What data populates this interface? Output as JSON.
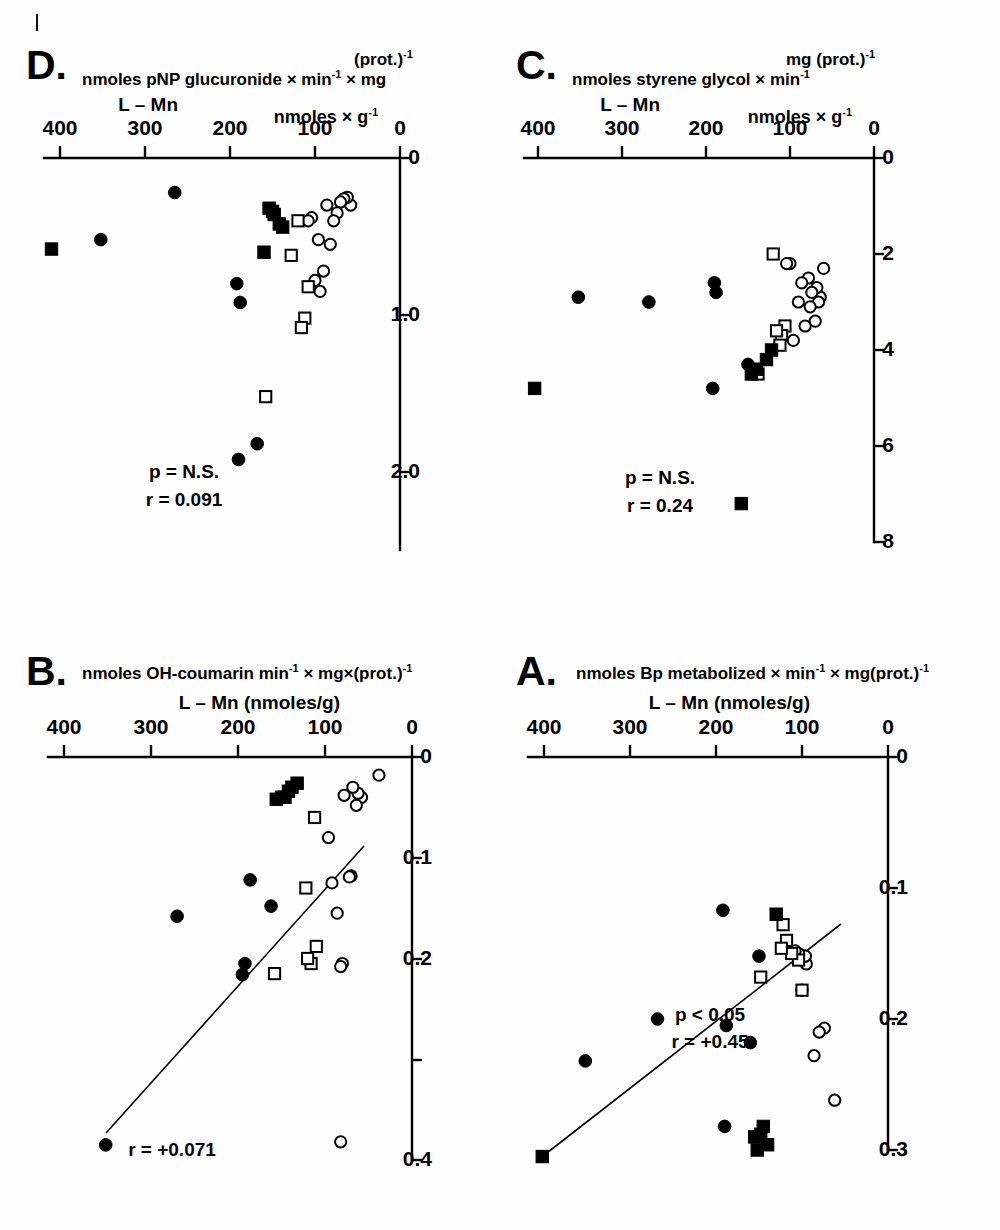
{
  "figure": {
    "title_absent": "",
    "orientation_note": "rotated-180",
    "panels": [
      "A.",
      "B.",
      "C.",
      "D."
    ],
    "marker_legend": {
      "filled_circle": "filled circle",
      "open_circle": "open circle",
      "filled_square": "filled square",
      "open_square": "open square"
    }
  },
  "chart_data": [
    {
      "type": "scatter",
      "panel": "A.",
      "title": "A.",
      "xlabel": "L - Mn (nmoles/g)",
      "ylabel": "nmoles Bp metabolized × min⁻¹ × mg(prot.)⁻¹",
      "xlim": [
        0,
        420
      ],
      "ylim": [
        0,
        0.32
      ],
      "xticks": [
        0,
        100,
        200,
        300,
        400
      ],
      "xticklabels": [
        "0",
        "100",
        "200",
        "300",
        "400"
      ],
      "yticks": [
        0,
        0.1,
        0.2,
        0.3
      ],
      "yticklabels": [
        "0",
        "0.1",
        "0.2",
        "0.3"
      ],
      "grid": false,
      "annotations": [
        "r = +0.45",
        "p < 0.05"
      ],
      "regression_line": {
        "x": [
          55,
          402
        ],
        "y": [
          0.128,
          0.305
        ]
      },
      "series": [
        {
          "name": "open circle",
          "marker": "open-circle",
          "points": [
            [
              62,
              0.262
            ],
            [
              74,
              0.207
            ],
            [
              80,
              0.21
            ],
            [
              86,
              0.228
            ],
            [
              95,
              0.158
            ],
            [
              97,
              0.152
            ],
            [
              96,
              0.152
            ],
            [
              100,
              0.178
            ],
            [
              104,
              0.15
            ],
            [
              108,
              0.148
            ],
            [
              112,
              0.15
            ],
            [
              118,
              0.143
            ]
          ]
        },
        {
          "name": "open square",
          "marker": "open-square",
          "points": [
            [
              100,
              0.178
            ],
            [
              104,
              0.155
            ],
            [
              112,
              0.15
            ],
            [
              118,
              0.14
            ],
            [
              122,
              0.128
            ],
            [
              124,
              0.146
            ],
            [
              148,
              0.168
            ]
          ]
        },
        {
          "name": "filled circle",
          "marker": "filled-circle",
          "points": [
            [
              150,
              0.152
            ],
            [
              160,
              0.218
            ],
            [
              188,
              0.205
            ],
            [
              190,
              0.282
            ],
            [
              192,
              0.117
            ],
            [
              268,
              0.2
            ],
            [
              352,
              0.232
            ]
          ]
        },
        {
          "name": "filled square",
          "marker": "filled-square",
          "points": [
            [
              130,
              0.12
            ],
            [
              140,
              0.296
            ],
            [
              145,
              0.282
            ],
            [
              148,
              0.288
            ],
            [
              152,
              0.3
            ],
            [
              155,
              0.29
            ],
            [
              402,
              0.305
            ]
          ]
        }
      ]
    },
    {
      "type": "scatter",
      "panel": "B.",
      "title": "B.",
      "xlabel": "L - Mn (nmoles/g)",
      "ylabel": "nmoles OH-coumarin min⁻¹ × mg×(prot.)⁻¹",
      "xlim": [
        0,
        420
      ],
      "ylim": [
        0,
        0.44
      ],
      "xticks": [
        0,
        100,
        200,
        300,
        400
      ],
      "xticklabels": [
        "0",
        "100",
        "200",
        "300",
        "400"
      ],
      "yticks": [
        0,
        0.1,
        0.2,
        0.3,
        0.4
      ],
      "yticklabels": [
        "0",
        "0.1",
        "0.2",
        "",
        "0.4"
      ],
      "grid": false,
      "annotations": [
        "r = +0.071"
      ],
      "regression_line": {
        "x": [
          55,
          352
        ],
        "y": [
          0.088,
          0.372
        ]
      },
      "series": [
        {
          "name": "open circle",
          "marker": "open-circle",
          "points": [
            [
              38,
              0.018
            ],
            [
              58,
              0.04
            ],
            [
              62,
              0.036
            ],
            [
              64,
              0.048
            ],
            [
              68,
              0.03
            ],
            [
              70,
              0.118
            ],
            [
              72,
              0.119
            ],
            [
              78,
              0.038
            ],
            [
              80,
              0.205
            ],
            [
              82,
              0.208
            ],
            [
              86,
              0.155
            ],
            [
              92,
              0.125
            ],
            [
              96,
              0.08
            ],
            [
              82,
              0.382
            ]
          ]
        },
        {
          "name": "open square",
          "marker": "open-square",
          "points": [
            [
              110,
              0.188
            ],
            [
              112,
              0.06
            ],
            [
              116,
              0.205
            ],
            [
              120,
              0.2
            ],
            [
              122,
              0.13
            ],
            [
              158,
              0.215
            ]
          ]
        },
        {
          "name": "filled circle",
          "marker": "filled-circle",
          "points": [
            [
              162,
              0.148
            ],
            [
              186,
              0.122
            ],
            [
              192,
              0.205
            ],
            [
              195,
              0.216
            ],
            [
              270,
              0.158
            ],
            [
              352,
              0.385
            ]
          ]
        },
        {
          "name": "filled square",
          "marker": "filled-square",
          "points": [
            [
              132,
              0.026
            ],
            [
              138,
              0.03
            ],
            [
              142,
              0.034
            ],
            [
              146,
              0.04
            ],
            [
              150,
              0.04
            ],
            [
              156,
              0.042
            ]
          ]
        }
      ]
    },
    {
      "type": "scatter",
      "panel": "C.",
      "title": "C.",
      "xlabel": "L - Mn",
      "xlabel2": "nmoles × g⁻¹",
      "ylabel": "nmoles styrene glycol × min⁻¹ × mg (prot.)⁻¹",
      "xlim": [
        0,
        420
      ],
      "ylim": [
        0,
        8.6
      ],
      "xticks": [
        0,
        100,
        200,
        300,
        400
      ],
      "xticklabels": [
        "0",
        "100",
        "200",
        "300",
        "400"
      ],
      "yticks": [
        0,
        2,
        4,
        6,
        8
      ],
      "yticklabels": [
        "0",
        "2",
        "4",
        "6",
        "8"
      ],
      "grid": false,
      "annotations": [
        "r = 0.24",
        "p = N.S."
      ],
      "regression_line": null,
      "series": [
        {
          "name": "open circle",
          "marker": "open-circle",
          "points": [
            [
              60,
              2.3
            ],
            [
              64,
              2.9
            ],
            [
              66,
              3.0
            ],
            [
              68,
              2.7
            ],
            [
              70,
              3.4
            ],
            [
              74,
              2.8
            ],
            [
              76,
              3.1
            ],
            [
              78,
              2.5
            ],
            [
              82,
              3.5
            ],
            [
              86,
              2.6
            ],
            [
              90,
              3.0
            ],
            [
              96,
              3.8
            ],
            [
              100,
              2.2
            ],
            [
              104,
              2.2
            ]
          ]
        },
        {
          "name": "open square",
          "marker": "open-square",
          "points": [
            [
              106,
              3.5
            ],
            [
              110,
              3.7
            ],
            [
              112,
              3.9
            ],
            [
              116,
              3.6
            ],
            [
              120,
              2.0
            ],
            [
              138,
              4.5
            ]
          ]
        },
        {
          "name": "filled circle",
          "marker": "filled-circle",
          "points": [
            [
              150,
              4.3
            ],
            [
              188,
              2.8
            ],
            [
              190,
              2.6
            ],
            [
              192,
              4.8
            ],
            [
              268,
              3.0
            ],
            [
              352,
              2.9
            ]
          ]
        },
        {
          "name": "filled square",
          "marker": "filled-square",
          "points": [
            [
              122,
              4.0
            ],
            [
              128,
              4.2
            ],
            [
              140,
              4.4
            ],
            [
              146,
              4.5
            ],
            [
              158,
              7.2
            ],
            [
              404,
              4.8
            ]
          ]
        }
      ]
    },
    {
      "type": "scatter",
      "panel": "D.",
      "title": "D.",
      "xlabel": "L - Mn",
      "xlabel2": "nmoles × g⁻¹",
      "ylabel": "nmoles pNP glucuronide × min⁻¹ × mg (prot.)⁻¹",
      "xlim": [
        0,
        420
      ],
      "ylim": [
        0,
        2.5
      ],
      "xticks": [
        0,
        100,
        200,
        300,
        400
      ],
      "xticklabels": [
        "0",
        "100",
        "200",
        "300",
        "400"
      ],
      "yticks": [
        0,
        1.0,
        2.0
      ],
      "yticklabels": [
        "0",
        "1.0",
        "2.0"
      ],
      "grid": false,
      "annotations": [
        "r = 0.091",
        "p = N.S."
      ],
      "regression_line": null,
      "series": [
        {
          "name": "open circle",
          "marker": "open-circle",
          "points": [
            [
              58,
              0.3
            ],
            [
              62,
              0.25
            ],
            [
              66,
              0.26
            ],
            [
              70,
              0.28
            ],
            [
              74,
              0.35
            ],
            [
              78,
              0.4
            ],
            [
              82,
              0.55
            ],
            [
              86,
              0.3
            ],
            [
              90,
              0.72
            ],
            [
              94,
              0.85
            ],
            [
              96,
              0.52
            ],
            [
              100,
              0.78
            ],
            [
              104,
              0.38
            ],
            [
              108,
              0.4
            ]
          ]
        },
        {
          "name": "open square",
          "marker": "open-square",
          "points": [
            [
              108,
              0.82
            ],
            [
              112,
              1.02
            ],
            [
              116,
              1.08
            ],
            [
              120,
              0.4
            ],
            [
              128,
              0.62
            ],
            [
              158,
              1.52
            ]
          ]
        },
        {
          "name": "filled circle",
          "marker": "filled-circle",
          "points": [
            [
              168,
              1.82
            ],
            [
              188,
              0.92
            ],
            [
              190,
              1.92
            ],
            [
              192,
              0.8
            ],
            [
              265,
              0.22
            ],
            [
              352,
              0.52
            ]
          ]
        },
        {
          "name": "filled square",
          "marker": "filled-square",
          "points": [
            [
              138,
              0.44
            ],
            [
              142,
              0.42
            ],
            [
              148,
              0.36
            ],
            [
              150,
              0.34
            ],
            [
              154,
              0.32
            ],
            [
              160,
              0.6
            ],
            [
              410,
              0.58
            ]
          ]
        }
      ]
    }
  ],
  "panelA": {
    "letter": "A.",
    "ylabel_main": "nmoles Bp metabolized × min",
    "ylabel_sup1": "-1",
    "ylabel_mid": " ×  mg(prot.)",
    "ylabel_sup2": "-1",
    "xlabel": "L – Mn (nmoles/g)",
    "annot1": "r = +0.45",
    "annot2": "p < 0.05",
    "yticklabels": [
      "0",
      "0.1",
      "0.2",
      "0.3"
    ],
    "xticklabels": [
      "0",
      "100",
      "200",
      "300",
      "400"
    ]
  },
  "panelB": {
    "letter": "B.",
    "ylabel_main": "nmoles OH-coumarin  min",
    "ylabel_sup1": "-1",
    "ylabel_mid": " ×  mg×(prot.)",
    "ylabel_sup2": "-1",
    "xlabel": "L – Mn  (nmoles/g)",
    "annot1": "r = +0.071",
    "yticklabels": [
      "0",
      "0.1",
      "0.2",
      "0.4"
    ],
    "xticklabels": [
      "0",
      "100",
      "200",
      "300",
      "400"
    ]
  },
  "panelC": {
    "letter": "C.",
    "ylabel_main": "nmoles  styrene   glycol  ×  min",
    "ylabel_sup1": "-1",
    "ylabel_mid": "mg (prot.)",
    "ylabel_sup2": "-1",
    "xlabel": "L – Mn",
    "xlabel_units": "nmoles × g",
    "xlabel_units_sup": "-1",
    "annot1": "r = 0.24",
    "annot2": "p = N.S.",
    "yticklabels": [
      "0",
      "2",
      "4",
      "6",
      "8"
    ],
    "xticklabels": [
      "0",
      "100",
      "200",
      "300",
      "400"
    ]
  },
  "panelD": {
    "letter": "D.",
    "ylabel_main": "nmoles   pNP  glucuronide × min",
    "ylabel_sup1": "-1",
    "ylabel_mid": " ×  mg",
    "ylabel_paren": "(prot.)",
    "ylabel_sup2": "-1",
    "xlabel": "L – Mn",
    "xlabel_units": "nmoles × g",
    "xlabel_units_sup": "-1",
    "annot1": "r = 0.091",
    "annot2": "p = N.S.",
    "yticklabels": [
      "0",
      "1.0",
      "2.0"
    ],
    "xticklabels": [
      "0",
      "100",
      "200",
      "300",
      "400"
    ]
  }
}
